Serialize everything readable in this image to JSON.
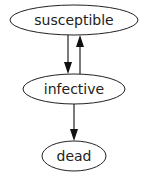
{
  "diagram": {
    "type": "directed-graph",
    "nodes": [
      {
        "id": "susceptible",
        "label": "susceptible",
        "shape": "ellipse"
      },
      {
        "id": "infective",
        "label": "infective",
        "shape": "ellipse"
      },
      {
        "id": "dead",
        "label": "dead",
        "shape": "ellipse"
      }
    ],
    "edges": [
      {
        "from": "susceptible",
        "to": "infective"
      },
      {
        "from": "infective",
        "to": "susceptible"
      },
      {
        "from": "infective",
        "to": "dead"
      }
    ],
    "colors": {
      "stroke": "#222222",
      "background": "#ffffff",
      "text": "#222222"
    }
  }
}
